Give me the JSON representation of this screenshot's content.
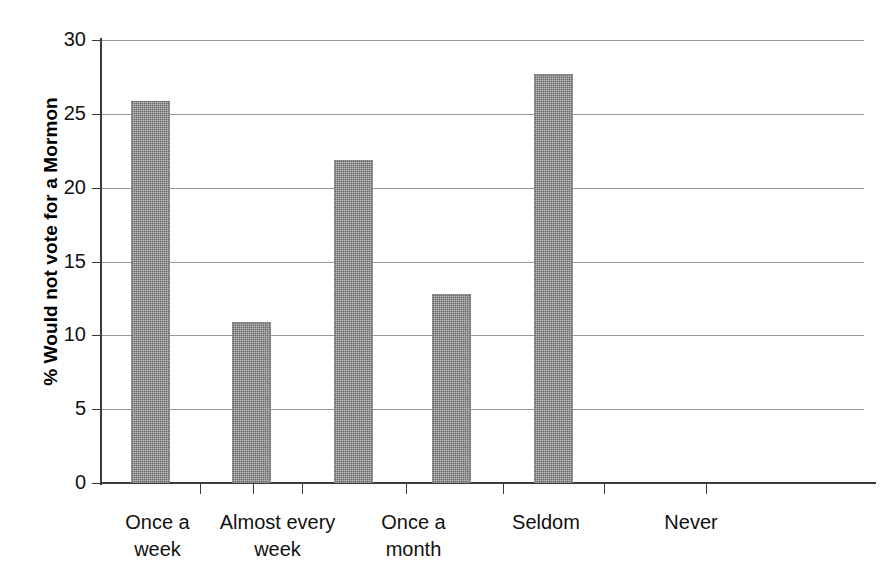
{
  "chart_data": {
    "type": "bar",
    "title": "",
    "subtitle": "",
    "xlabel": "",
    "ylabel": "% Would not vote for a Mormon",
    "categories": [
      "Once a week",
      "Almost every week",
      "Once a month",
      "Seldom",
      "Never"
    ],
    "category_lines": [
      [
        "Once a",
        "week"
      ],
      [
        "Almost every",
        "week"
      ],
      [
        "Once a",
        "month"
      ],
      [
        "Seldom",
        ""
      ],
      [
        "Never",
        ""
      ]
    ],
    "values": [
      25.9,
      10.9,
      21.9,
      12.8,
      27.7
    ],
    "ylim": [
      0,
      30
    ],
    "ytick_values": [
      0,
      5,
      10,
      15,
      20,
      25,
      30
    ],
    "ytick_labels": [
      "0",
      "5",
      "10",
      "15",
      "20",
      "25",
      "30"
    ],
    "grid": true,
    "grid_axis": "y",
    "legend": false,
    "legend_position": "none",
    "bar_color": "#6f6f6f",
    "grid_color": "#9a9a9a",
    "axis_color": "#3a3a3a",
    "background_color": "#ffffff"
  }
}
